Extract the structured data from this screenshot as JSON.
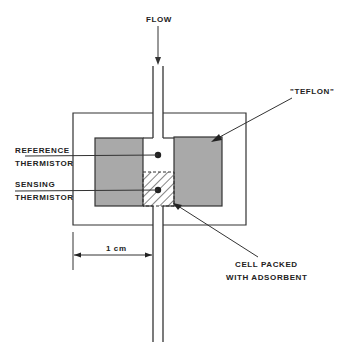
{
  "diagram": {
    "type": "thermistor flow cell schematic",
    "labels": {
      "flow": "FLOW",
      "teflon": "\"TEFLON\"",
      "reference_line1": "REFERENCE",
      "reference_line2": "THERMISTOR",
      "sensing_line1": "SENSING",
      "sensing_line2": "THERMISTOR",
      "scale": "1 cm",
      "cell_line1": "CELL PACKED",
      "cell_line2": "WITH ADSORBENT"
    },
    "colors": {
      "line": "#333333",
      "teflon_fill": "#a9a9a9",
      "background": "#ffffff"
    }
  }
}
